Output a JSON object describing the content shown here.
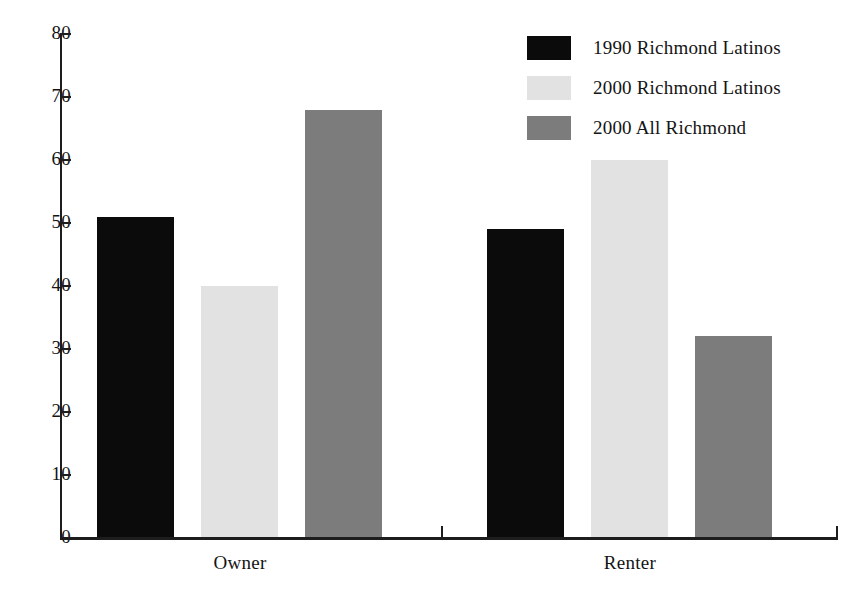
{
  "chart_data": {
    "type": "bar",
    "title": "",
    "subtitle": "",
    "xlabel": "",
    "ylabel": "",
    "categories": [
      "Owner",
      "Renter"
    ],
    "series": [
      {
        "name": "1990 Richmond Latinos",
        "color": "#0b0b0b",
        "values": [
          51,
          49
        ]
      },
      {
        "name": "2000 Richmond Latinos",
        "color": "#e2e2e2",
        "values": [
          40,
          60
        ]
      },
      {
        "name": "2000 All Richmond",
        "color": "#7c7c7c",
        "values": [
          68,
          32
        ]
      }
    ],
    "ylim": [
      0,
      80
    ],
    "ytick_values": [
      80,
      70,
      60,
      50,
      40,
      30,
      20,
      10,
      0
    ],
    "ytick_labels": [
      "80",
      "70",
      "60",
      "50",
      "40",
      "30",
      "20",
      "10",
      "0"
    ],
    "grid": false,
    "legend_position": "top-right",
    "annotations": []
  },
  "legend": {
    "entries": [
      {
        "label": "1990 Richmond Latinos",
        "swatch": "black-swatch"
      },
      {
        "label": "2000 Richmond Latinos",
        "swatch": "light-gray-swatch"
      },
      {
        "label": "2000 All Richmond",
        "swatch": "medium-gray-swatch"
      }
    ]
  },
  "axes": {
    "x_group_labels": [
      "Owner",
      "Renter"
    ],
    "y_labels": [
      "80",
      "70",
      "60",
      "50",
      "40",
      "30",
      "20",
      "10",
      "0"
    ]
  },
  "colors": {
    "series_1": "#0b0b0b",
    "series_2": "#e2e2e2",
    "series_3": "#7c7c7c",
    "axis": "#1d1d1d",
    "text": "#141414",
    "background": "#ffffff"
  }
}
